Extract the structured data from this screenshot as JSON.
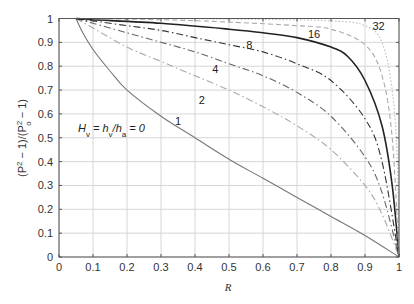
{
  "chart_data": {
    "type": "line",
    "title": "",
    "xlabel": "R",
    "ylabel": "(P² − 1)/(P₀² − 1)",
    "xlim": [
      0,
      1
    ],
    "ylim": [
      0,
      1
    ],
    "grid": true,
    "x_ticks": [
      "0",
      "0.1",
      "0.2",
      "0.3",
      "0.4",
      "0.5",
      "0.6",
      "0.7",
      "0.8",
      "0.9",
      "1"
    ],
    "y_ticks": [
      "0",
      "0.1",
      "0.2",
      "0.3",
      "0.4",
      "0.5",
      "0.6",
      "0.7",
      "0.8",
      "0.9",
      "1"
    ],
    "annotation": "H_v = h_v/h_a = 0",
    "series": [
      {
        "name": "1",
        "style": "solid",
        "color": "#777777",
        "points": [
          [
            0.05,
            1
          ],
          [
            0.07,
            0.94
          ],
          [
            0.1,
            0.87
          ],
          [
            0.15,
            0.78
          ],
          [
            0.2,
            0.7
          ],
          [
            0.3,
            0.59
          ],
          [
            0.4,
            0.5
          ],
          [
            0.5,
            0.41
          ],
          [
            0.6,
            0.33
          ],
          [
            0.7,
            0.25
          ],
          [
            0.8,
            0.17
          ],
          [
            0.9,
            0.09
          ],
          [
            1,
            0
          ]
        ],
        "label_pos": [
          0.35,
          0.57
        ]
      },
      {
        "name": "2",
        "style": "dashdot",
        "color": "#aaaaaa",
        "points": [
          [
            0.05,
            1
          ],
          [
            0.1,
            0.96
          ],
          [
            0.2,
            0.88
          ],
          [
            0.3,
            0.82
          ],
          [
            0.4,
            0.76
          ],
          [
            0.5,
            0.7
          ],
          [
            0.6,
            0.63
          ],
          [
            0.7,
            0.55
          ],
          [
            0.8,
            0.45
          ],
          [
            0.9,
            0.3
          ],
          [
            0.95,
            0.18
          ],
          [
            1,
            0
          ]
        ],
        "label_pos": [
          0.42,
          0.66
        ]
      },
      {
        "name": "4",
        "style": "dashdot",
        "color": "#666666",
        "points": [
          [
            0.05,
            1
          ],
          [
            0.1,
            0.98
          ],
          [
            0.2,
            0.94
          ],
          [
            0.3,
            0.9
          ],
          [
            0.4,
            0.86
          ],
          [
            0.5,
            0.81
          ],
          [
            0.6,
            0.76
          ],
          [
            0.7,
            0.69
          ],
          [
            0.8,
            0.59
          ],
          [
            0.9,
            0.42
          ],
          [
            0.95,
            0.27
          ],
          [
            1,
            0
          ]
        ],
        "label_pos": [
          0.46,
          0.79
        ]
      },
      {
        "name": "8",
        "style": "dashdot",
        "color": "#333333",
        "points": [
          [
            0.05,
            1
          ],
          [
            0.1,
            0.99
          ],
          [
            0.2,
            0.97
          ],
          [
            0.3,
            0.95
          ],
          [
            0.4,
            0.92
          ],
          [
            0.5,
            0.89
          ],
          [
            0.6,
            0.86
          ],
          [
            0.7,
            0.81
          ],
          [
            0.8,
            0.74
          ],
          [
            0.9,
            0.58
          ],
          [
            0.95,
            0.4
          ],
          [
            1,
            0
          ]
        ],
        "label_pos": [
          0.56,
          0.89
        ]
      },
      {
        "name": "16",
        "style": "solid",
        "color": "#222222",
        "points": [
          [
            0.05,
            1
          ],
          [
            0.1,
            0.995
          ],
          [
            0.3,
            0.98
          ],
          [
            0.5,
            0.955
          ],
          [
            0.6,
            0.94
          ],
          [
            0.7,
            0.92
          ],
          [
            0.8,
            0.88
          ],
          [
            0.85,
            0.84
          ],
          [
            0.9,
            0.74
          ],
          [
            0.95,
            0.55
          ],
          [
            0.98,
            0.3
          ],
          [
            1,
            0
          ]
        ],
        "label_pos": [
          0.75,
          0.935
        ]
      },
      {
        "name": "32",
        "style": "dashed",
        "color": "#aaaaaa",
        "points": [
          [
            0.05,
            1
          ],
          [
            0.3,
            0.995
          ],
          [
            0.5,
            0.985
          ],
          [
            0.7,
            0.97
          ],
          [
            0.8,
            0.955
          ],
          [
            0.9,
            0.89
          ],
          [
            0.95,
            0.76
          ],
          [
            0.98,
            0.5
          ],
          [
            1,
            0
          ]
        ],
        "label_pos": [
          0.94,
          0.97
        ]
      },
      {
        "name": "",
        "style": "dotted",
        "color": "#bbbbbb",
        "points": [
          [
            0.05,
            1
          ],
          [
            0.5,
            0.998
          ],
          [
            0.8,
            0.99
          ],
          [
            0.9,
            0.97
          ],
          [
            0.95,
            0.9
          ],
          [
            0.98,
            0.7
          ],
          [
            0.995,
            0.4
          ],
          [
            1,
            0
          ]
        ],
        "label_pos": null
      }
    ]
  }
}
